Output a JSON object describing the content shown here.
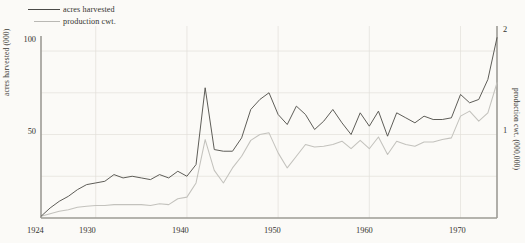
{
  "chart_data": {
    "type": "line",
    "title": "",
    "subtitle": "",
    "xlabel": "",
    "ylabel": "acres harvested (000)",
    "y2label": "production cwt. (000,000)",
    "grid": true,
    "legend_position": "top-left",
    "xlim": [
      1924,
      1974
    ],
    "ylim": [
      0,
      115
    ],
    "y2lim": [
      0,
      2.3
    ],
    "xticks": [
      1924,
      1930,
      1940,
      1950,
      1960,
      1970
    ],
    "xticklabels": [
      "1924",
      "1930",
      "1940",
      "1950",
      "1960",
      "1970"
    ],
    "yticks": [
      50,
      100
    ],
    "yticklabels": [
      "50",
      "100"
    ],
    "y2ticks": [
      1,
      2
    ],
    "y2ticklabels": [
      "1",
      "2"
    ],
    "x": [
      1924,
      1925,
      1926,
      1927,
      1928,
      1929,
      1930,
      1931,
      1932,
      1933,
      1934,
      1935,
      1936,
      1937,
      1938,
      1939,
      1940,
      1941,
      1942,
      1943,
      1944,
      1945,
      1946,
      1947,
      1948,
      1949,
      1950,
      1951,
      1952,
      1953,
      1954,
      1955,
      1956,
      1957,
      1958,
      1959,
      1960,
      1961,
      1962,
      1963,
      1964,
      1965,
      1966,
      1967,
      1968,
      1969,
      1970,
      1971,
      1972,
      1973,
      1974
    ],
    "series": [
      {
        "name": "acres harvested",
        "axis": "left",
        "color": "#55544f",
        "unit": "thousand acres",
        "values": [
          1,
          6,
          10,
          13,
          17,
          20,
          21,
          22,
          26,
          24,
          25,
          24,
          23,
          26,
          24,
          28,
          25,
          32,
          78,
          41,
          40,
          40,
          48,
          65,
          71,
          75,
          62,
          56,
          67,
          62,
          53,
          58,
          65,
          57,
          50,
          63,
          55,
          64,
          49,
          63,
          60,
          57,
          61,
          59,
          59,
          60,
          74,
          69,
          71,
          83,
          108
        ]
      },
      {
        "name": "production cwt.",
        "axis": "right",
        "color": "#c3c2bd",
        "unit": "million cwt.",
        "values": [
          0.02,
          0.05,
          0.08,
          0.1,
          0.13,
          0.14,
          0.15,
          0.15,
          0.16,
          0.16,
          0.16,
          0.16,
          0.15,
          0.17,
          0.16,
          0.23,
          0.25,
          0.42,
          0.94,
          0.57,
          0.42,
          0.6,
          0.74,
          0.93,
          1.0,
          1.02,
          0.78,
          0.6,
          0.74,
          0.88,
          0.85,
          0.86,
          0.88,
          0.92,
          0.83,
          0.93,
          0.83,
          0.97,
          0.76,
          0.92,
          0.88,
          0.86,
          0.91,
          0.91,
          0.94,
          0.96,
          1.22,
          1.28,
          1.16,
          1.26,
          1.62
        ]
      }
    ]
  },
  "legend": {
    "items": [
      {
        "label": "acres harvested",
        "style": "dark-line"
      },
      {
        "label": "production cwt.",
        "style": "light-line"
      }
    ]
  },
  "axes": {
    "left_title": "acres harvested (000)",
    "right_title": "production cwt. (000,000)",
    "left_ticks": [
      "100",
      "50"
    ],
    "right_ticks": [
      "2",
      "1"
    ],
    "x_ticks": [
      "1924",
      "1930",
      "1940",
      "1950",
      "1960",
      "1970"
    ]
  }
}
